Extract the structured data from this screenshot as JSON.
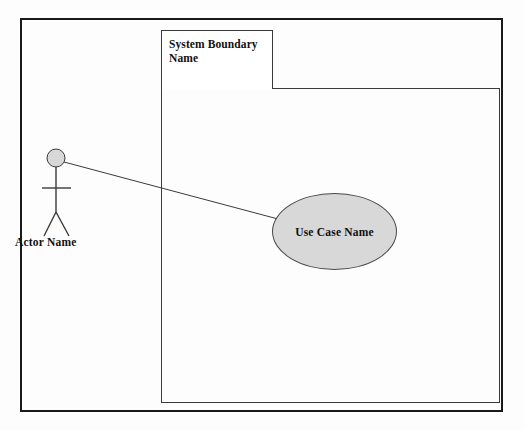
{
  "diagram": {
    "type": "uml-use-case-diagram",
    "background_color": "#fdfdfd",
    "frame": {
      "name": "outer-frame",
      "stroke_color": "#1a1a1a"
    },
    "system_boundary": {
      "label": "System Boundary\nName",
      "label_line1": "System Boundary",
      "label_line2": "Name",
      "stroke_color": "#3a3a3a",
      "fill_color": "#ffffff"
    },
    "use_case": {
      "label": "Use Case Name",
      "shape": "ellipse",
      "fill_color": "#d8d8d8",
      "stroke_color": "#4a4a4a"
    },
    "actor": {
      "label": "Actor Name",
      "icon": "stick-figure-actor",
      "head_fill_color": "#d8d8d8",
      "stroke_color": "#3a3a3a"
    },
    "association": {
      "name": "actor-use-case-association",
      "stroke_color": "#3a3a3a"
    }
  }
}
